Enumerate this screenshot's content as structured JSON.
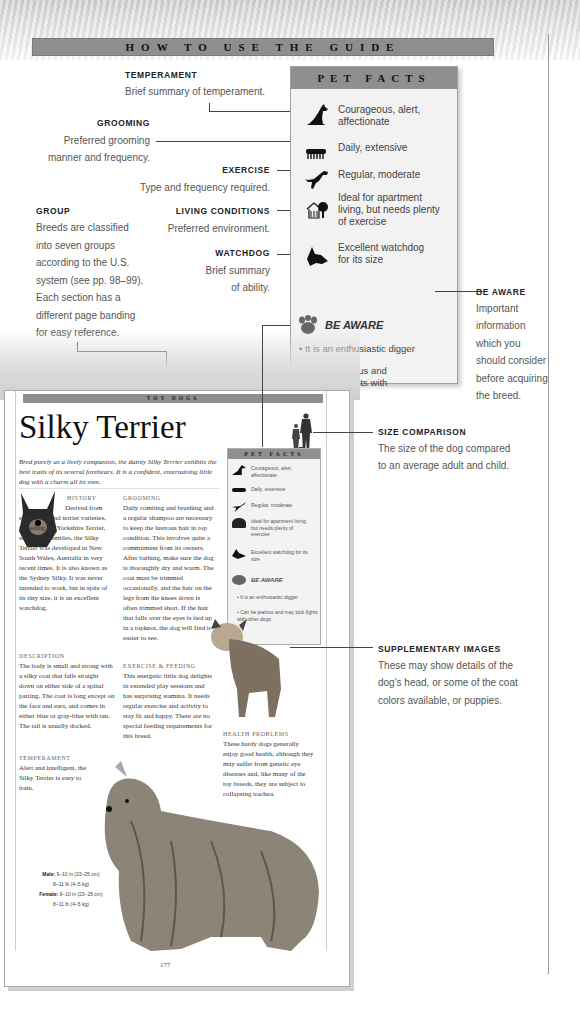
{
  "header": {
    "banner_title": "HOW TO USE THE GUIDE"
  },
  "callouts": {
    "temperament": {
      "label": "TEMPERAMENT",
      "text": "Brief summary of temperament."
    },
    "grooming": {
      "label": "GROOMING",
      "text_line1": "Preferred grooming",
      "text_line2": "manner and frequency."
    },
    "exercise": {
      "label": "EXERCISE",
      "text": "Type and frequency required."
    },
    "living_conditions": {
      "label": "LIVING CONDITIONS",
      "text": "Preferred environment."
    },
    "watchdog": {
      "label": "WATCHDOG",
      "text_line1": "Brief summary",
      "text_line2": "of ability."
    },
    "group": {
      "label": "GROUP",
      "lines": [
        "Breeds are classified",
        "into seven groups",
        "according to the U.S.",
        "system (see pp. 98–99).",
        "Each section has a",
        "different page banding",
        "for easy reference."
      ]
    },
    "be_aware": {
      "label": "BE AWARE",
      "lines": [
        "Important",
        "information",
        "which you",
        "should consider",
        "before acquiring",
        "the breed."
      ]
    },
    "size_comparison": {
      "label": "SIZE COMPARISON",
      "lines": [
        "The size of the dog compared",
        "to an average adult and child."
      ]
    },
    "supplementary_images": {
      "label": "SUPPLEMENTARY IMAGES",
      "lines": [
        "These may show details of the",
        "dog's head, or some of the coat",
        "colors available, or puppies."
      ]
    }
  },
  "pet_facts": {
    "title": "PET FACTS",
    "rows": [
      {
        "icon": "sitting-dog-icon",
        "line1": "Courageous, alert,",
        "line2": "affectionate"
      },
      {
        "icon": "comb-icon",
        "line1": "Daily, extensive",
        "line2": ""
      },
      {
        "icon": "leaping-dog-icon",
        "line1": "Regular, moderate",
        "line2": ""
      },
      {
        "icon": "house-tree-icon",
        "line1": "Ideal for apartment",
        "line2": "living, but needs plenty",
        "line3": "of exercise"
      },
      {
        "icon": "dog-head-icon",
        "line1": "Excellent watchdog",
        "line2": "for its size"
      }
    ],
    "be_aware_title": "BE AWARE",
    "be_aware_items": [
      {
        "line1": "• It is an enthusiastic digger"
      },
      {
        "line1": "• Can be jealous and",
        "line2": "may pick fights with",
        "line3": "other dogs"
      }
    ]
  },
  "sample_page": {
    "group_banner": "TOY DOGS",
    "breed_name": "Silky Terrier",
    "intro": "Bred purely as a lively companion, the dainty Silky Terrier exhibits the best traits of its several forebears. It is a confident, entertaining little dog with a charm all its own.",
    "history": {
      "heading": "History",
      "text": "Derived from several toy and terrier varieties, including the Yorkshire Terrier, which it resembles, the Silky Terrier was developed in New South Wales, Australia in very recent times. It is also known as the Sydney Silky. It was never intended to work, but in spite of its tiny size, it is an excellent watchdog."
    },
    "description": {
      "heading": "Description",
      "text": "The body is small and strong with a silky coat that falls straight down on either side of a spinal parting. The coat is long except on the face and ears, and comes in either blue or gray-blue with tan. The tail is usually docked."
    },
    "temperament": {
      "heading": "Temperament",
      "text": "Alert and intelligent, the Silky Terrier is easy to train."
    },
    "grooming": {
      "heading": "Grooming",
      "text": "Daily combing and brushing and a regular shampoo are necessary to keep the lustrous hair in top condition. This involves quite a commitment from its owners. After bathing, make sure the dog is thoroughly dry and warm. The coat must be trimmed occasionally, and the hair on the legs from the knees down is often trimmed short. If the hair that falls over the eyes is tied up in a topknot, the dog will find it easier to see."
    },
    "exercise_feeding": {
      "heading": "Exercise & Feeding",
      "text": "This energetic little dog delights in extended play sessions and has surprising stamina. It needs regular exercise and activity to stay fit and happy. There are no special feeding requirements for this breed."
    },
    "health": {
      "heading": "Health Problems",
      "text": "These hardy dogs generally enjoy good health, although they may suffer from genetic eye diseases and, like many of the toy breeds, they are subject to collapsing trachea."
    },
    "mini_pet_facts": {
      "title": "PET FACTS",
      "rows": [
        "Courageous, alert, affectionate",
        "Daily, extensive",
        "Regular, moderate",
        "Ideal for apartment living, but needs plenty of exercise",
        "Excellent watchdog for its size"
      ],
      "be_aware_title": "BE AWARE",
      "be_aware_items": [
        "• It is an enthusiastic digger",
        "• Can be jealous and may pick fights with other dogs"
      ]
    },
    "stats": {
      "male_label": "Male:",
      "male_height": "9–10 in (23–25 cm)",
      "male_weight": "8–11 lb (4–5 kg)",
      "female_label": "Female:",
      "female_height": "9–10 in (23–25 cm)",
      "female_weight": "8–11 lb (4–5 kg)"
    },
    "page_number": "177"
  },
  "colors": {
    "banner": "#8e8e8e",
    "panel": "#f2f2f2",
    "text": "#555555",
    "line": "#444444"
  }
}
